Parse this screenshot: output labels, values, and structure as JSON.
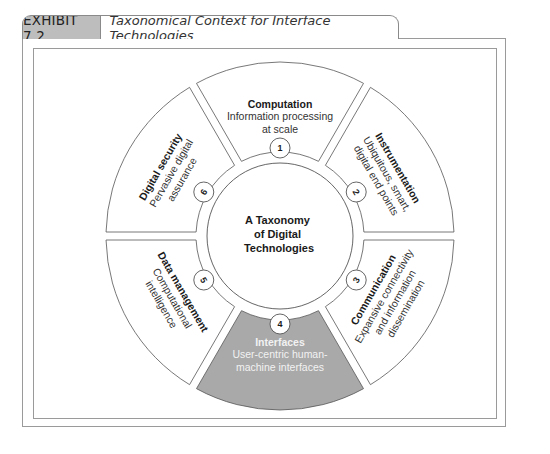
{
  "exhibit": {
    "label": "EXHIBIT 7.2",
    "title": "Taxonomical Context for Interface Technologies"
  },
  "diagram": {
    "center": {
      "lines": [
        "A Taxonomy",
        "of Digital",
        "Technologies"
      ]
    },
    "segments": [
      {
        "number": "1",
        "title": "Computation",
        "desc": [
          "Information processing",
          "at scale"
        ],
        "highlighted": false
      },
      {
        "number": "2",
        "title": "Instrumentation",
        "desc": [
          "Ubiquitous, smart,",
          "digital end points"
        ],
        "highlighted": false
      },
      {
        "number": "3",
        "title": "Communication",
        "desc": [
          "Expansive connectivity",
          "and information",
          "dissemination"
        ],
        "highlighted": false
      },
      {
        "number": "4",
        "title": "Interfaces",
        "desc": [
          "User-centric human-",
          "machine interfaces"
        ],
        "highlighted": true
      },
      {
        "number": "5",
        "title": "Data management",
        "desc": [
          "Computational",
          "intelligence"
        ],
        "highlighted": false
      },
      {
        "number": "6",
        "title": "Digital security",
        "desc": [
          "Pervasive digital",
          "assurance"
        ],
        "highlighted": false
      }
    ],
    "colors": {
      "highlight_fill": "#a9a9a9",
      "stroke": "#555555",
      "frame": "#9a9a9a",
      "label_bg": "#bdbdbd"
    }
  }
}
